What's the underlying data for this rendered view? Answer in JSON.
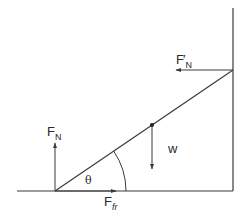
{
  "diagram": {
    "colors": {
      "line": "#3a3a3a",
      "text": "#2a2a2a",
      "background": "#ffffff"
    },
    "labels": {
      "wall_normal": {
        "main": "F",
        "prime": "′",
        "sub": "N"
      },
      "floor_normal": {
        "main": "F",
        "sub": "N"
      },
      "friction": {
        "main": "F",
        "sub": "fr"
      },
      "weight": "w",
      "angle": "θ"
    }
  }
}
